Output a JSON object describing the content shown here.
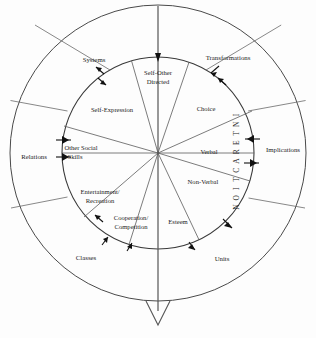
{
  "diagram": {
    "center": {
      "x": 158,
      "y": 153
    },
    "outer_radius": 148,
    "inner_radius": 96,
    "axis_label": "INTERACTION",
    "stroke_color": "#4a4a4a",
    "text_color": "#1c1c1c",
    "background": "#fdfdfd",
    "outer_ring_labels": [
      {
        "id": "systems",
        "text": "Systems",
        "x": 94,
        "y": 60
      },
      {
        "id": "transformations",
        "text": "Transformations",
        "x": 228,
        "y": 58
      },
      {
        "id": "implications",
        "text": "Implications",
        "x": 283,
        "y": 150
      },
      {
        "id": "units",
        "text": "Units",
        "x": 222,
        "y": 259
      },
      {
        "id": "classes",
        "text": "Classes",
        "x": 86,
        "y": 258
      },
      {
        "id": "relations",
        "text": "Relations",
        "x": 34,
        "y": 157
      }
    ],
    "inner_ring_labels": [
      {
        "id": "self-other-directed",
        "lines": [
          "Self-Other",
          "Directed"
        ],
        "x": 158,
        "y": 77
      },
      {
        "id": "choice",
        "lines": [
          "Choice"
        ],
        "x": 206,
        "y": 109
      },
      {
        "id": "verbal",
        "lines": [
          "Verbal"
        ],
        "x": 209,
        "y": 152
      },
      {
        "id": "non-verbal",
        "lines": [
          "Non-Verbal"
        ],
        "x": 203,
        "y": 182
      },
      {
        "id": "esteem",
        "lines": [
          "Esteem"
        ],
        "x": 178,
        "y": 222
      },
      {
        "id": "cooperation-competition",
        "lines": [
          "Cooperation/",
          "Competition"
        ],
        "x": 131,
        "y": 222
      },
      {
        "id": "entertainment-recreation",
        "lines": [
          "Entertainment/",
          "Recreation"
        ],
        "x": 100,
        "y": 196
      },
      {
        "id": "other-social-skills",
        "lines": [
          "Other Social",
          "Skills"
        ],
        "x": 78,
        "y": 152
      },
      {
        "id": "self-expression",
        "lines": [
          "Self-Expression"
        ],
        "x": 112,
        "y": 110
      }
    ]
  }
}
